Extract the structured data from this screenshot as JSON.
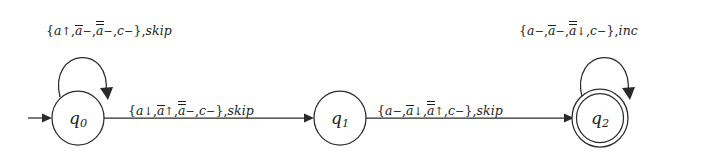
{
  "diagram": {
    "kind": "finite-state-automaton",
    "background_color": "#ffffff",
    "stroke_color": "#2b2b2b",
    "text_color": "#1d1d1d"
  },
  "states": [
    {
      "id": "q0",
      "name": "q",
      "subscript": "0",
      "cx": 78,
      "cy": 118,
      "r": 26,
      "accepting": false,
      "initial": true
    },
    {
      "id": "q1",
      "name": "q",
      "subscript": "1",
      "cx": 340,
      "cy": 118,
      "r": 26,
      "accepting": false,
      "initial": false
    },
    {
      "id": "q2",
      "name": "q",
      "subscript": "2",
      "cx": 600,
      "cy": 118,
      "r": 26,
      "accepting": true,
      "initial": false
    }
  ],
  "transitions": [
    {
      "id": "t-q0-self",
      "from": "q0",
      "to": "q0",
      "kind": "self-loop",
      "label_parts": {
        "open": "{",
        "s1_base": "a",
        "s1_op": "↑",
        "s2_base": "a",
        "s2_op": "−",
        "s2_bars": 1,
        "s3_base": "a",
        "s3_op": "−",
        "s3_bars": 2,
        "s4_base": "c",
        "s4_op": "−",
        "close": "}",
        "action": "skip"
      },
      "label_text": "{a↑,ā−,ā−,c−},skip",
      "label_x": 46,
      "label_y": 21
    },
    {
      "id": "t-q0-q1",
      "from": "q0",
      "to": "q1",
      "kind": "edge",
      "label_parts": {
        "open": "{",
        "s1_base": "a",
        "s1_op": "↓",
        "s2_base": "a",
        "s2_op": "↑",
        "s2_bars": 1,
        "s3_base": "a",
        "s3_op": "−",
        "s3_bars": 2,
        "s4_base": "c",
        "s4_op": "−",
        "close": "}",
        "action": "skip"
      },
      "label_text": "{a↓,ā↑,ā−,c−},skip",
      "label_x": 128,
      "label_y": 101
    },
    {
      "id": "t-q1-q2",
      "from": "q1",
      "to": "q2",
      "kind": "edge",
      "label_parts": {
        "open": "{",
        "s1_base": "a",
        "s1_op": "−",
        "s2_base": "a",
        "s2_op": "↓",
        "s2_bars": 1,
        "s3_base": "a",
        "s3_op": "↑",
        "s3_bars": 2,
        "s4_base": "c",
        "s4_op": "−",
        "close": "}",
        "action": "skip"
      },
      "label_text": "{a−,ā↓,ā↑,c−},skip",
      "label_x": 377,
      "label_y": 101
    },
    {
      "id": "t-q2-self",
      "from": "q2",
      "to": "q2",
      "kind": "self-loop",
      "label_parts": {
        "open": "{",
        "s1_base": "a",
        "s1_op": "−",
        "s2_base": "a",
        "s2_op": "−",
        "s2_bars": 1,
        "s3_base": "a",
        "s3_op": "↓",
        "s3_bars": 2,
        "s4_base": "c",
        "s4_op": "−",
        "close": "}",
        "action": "inc"
      },
      "label_text": "{a−,ā−,ā↓,c−},inc",
      "label_x": 519,
      "label_y": 21
    }
  ]
}
